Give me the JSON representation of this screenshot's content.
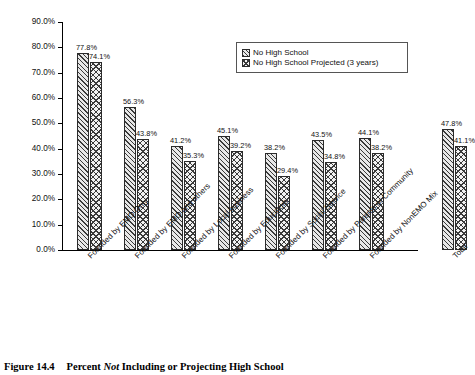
{
  "caption": {
    "number": "Figure 14.4",
    "text_before": "Percent ",
    "text_italic": "Not",
    "text_after": " Including or Projecting High School"
  },
  "legend": {
    "position": "top-right",
    "items": [
      {
        "label": "No High School",
        "pattern": "diagonal-hatch"
      },
      {
        "label": "No High School Projected (3 years)",
        "pattern": "cross-hatch"
      }
    ]
  },
  "axis": {
    "y_ticks": [
      "0.0%",
      "10.0%",
      "20.0%",
      "30.0%",
      "40.0%",
      "50.0%",
      "60.0%",
      "70.0%",
      "80.0%",
      "90.0%"
    ]
  },
  "chart_data": {
    "type": "bar",
    "title": "",
    "xlabel": "",
    "ylabel": "",
    "ylim": [
      0,
      90
    ],
    "ytick_step": 10,
    "grid": false,
    "legend_position": "top-right",
    "categories": [
      "Founded by EMO Only",
      "Founded by EMO and others",
      "Founded by Local business",
      "Founded by Educators",
      "Founded by Social Service",
      "Founded by Parents or Community",
      "Founded by NonEMO Mix",
      "Total"
    ],
    "series": [
      {
        "name": "No High School",
        "values": [
          77.8,
          56.3,
          41.2,
          45.1,
          38.2,
          43.5,
          44.1,
          47.8
        ],
        "labels": [
          "77.8%",
          "56.3%",
          "41.2%",
          "45.1%",
          "38.2%",
          "43.5%",
          "44.1%",
          "47.8%"
        ]
      },
      {
        "name": "No High School Projected (3 years)",
        "values": [
          74.1,
          43.8,
          35.3,
          39.2,
          29.4,
          34.8,
          38.2,
          41.1
        ],
        "labels": [
          "74.1%",
          "43.8%",
          "35.3%",
          "39.2%",
          "29.4%",
          "34.8%",
          "38.2%",
          "41.1%"
        ]
      }
    ]
  }
}
